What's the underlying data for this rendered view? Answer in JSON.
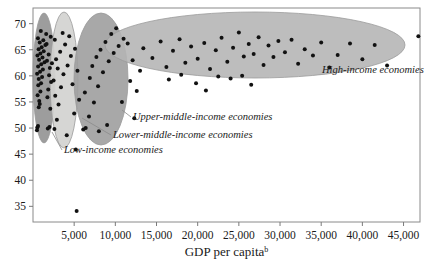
{
  "chart_data": {
    "type": "scatter",
    "title": "",
    "xlabel": "GDP per capita",
    "xlabel_superscript": "b",
    "ylabel": "",
    "xlim": [
      0,
      47000
    ],
    "ylim": [
      32,
      73
    ],
    "grid": false,
    "legend_position": "inline-annotations",
    "xticks": [
      5000,
      10000,
      15000,
      20000,
      25000,
      30000,
      35000,
      40000,
      45000
    ],
    "xtick_labels": [
      "5,000",
      "10,000",
      "15,000",
      "20,000",
      "25,000",
      "30,000",
      "35,000",
      "40,000",
      "45,000"
    ],
    "yticks": [
      35,
      40,
      45,
      50,
      55,
      60,
      65,
      70
    ],
    "ytick_labels": [
      "35",
      "40",
      "45",
      "50",
      "55",
      "60",
      "65",
      "70"
    ],
    "groups": [
      {
        "name": "low-income-economies",
        "label": "Low-income economies",
        "color": "#8c8c8c",
        "fill_opacity": 0.85,
        "ellipse": {
          "cx": 44,
          "cy": 78,
          "rx": 11,
          "ry": 65,
          "rotate": 0
        },
        "label_pos": {
          "x": 64,
          "y": 153
        },
        "leader": [
          [
            62,
            150
          ],
          [
            52,
            132
          ]
        ]
      },
      {
        "name": "lower-middle-income-economies",
        "label": "Lower-middle-income economies",
        "color": "#d3d3d0",
        "fill_opacity": 0.92,
        "ellipse": {
          "cx": 64,
          "cy": 80,
          "rx": 14,
          "ry": 68,
          "rotate": 0
        },
        "label_pos": {
          "x": 113,
          "y": 138
        },
        "leader": [
          [
            111,
            135
          ],
          [
            82,
            118
          ]
        ]
      },
      {
        "name": "upper-middle-income-economies",
        "label": "Upper-middle-income economies",
        "color": "#9e9e9e",
        "fill_opacity": 0.9,
        "ellipse": {
          "cx": 101,
          "cy": 79,
          "rx": 27,
          "ry": 66,
          "rotate": 0
        },
        "label_pos": {
          "x": 133,
          "y": 120
        },
        "leader": [
          [
            131,
            117
          ],
          [
            122,
            110
          ]
        ]
      },
      {
        "name": "high-income-economies",
        "label": "High-income economies",
        "color": "#b4b4b4",
        "fill_opacity": 0.88,
        "ellipse": {
          "cx": 255,
          "cy": 45,
          "rx": 150,
          "ry": 33,
          "rotate": 0
        },
        "label_pos": {
          "x": 322,
          "y": 73
        },
        "leader": null
      }
    ],
    "points": [
      {
        "x": 480,
        "y": 49.6
      },
      {
        "x": 520,
        "y": 50.1
      },
      {
        "x": 610,
        "y": 50.4
      },
      {
        "x": 700,
        "y": 54.0
      },
      {
        "x": 760,
        "y": 55.2
      },
      {
        "x": 820,
        "y": 54.6
      },
      {
        "x": 560,
        "y": 56.3
      },
      {
        "x": 900,
        "y": 57.0
      },
      {
        "x": 640,
        "y": 58.2
      },
      {
        "x": 980,
        "y": 58.6
      },
      {
        "x": 700,
        "y": 59.4
      },
      {
        "x": 1100,
        "y": 59.8
      },
      {
        "x": 500,
        "y": 60.4
      },
      {
        "x": 860,
        "y": 60.8
      },
      {
        "x": 1200,
        "y": 61.2
      },
      {
        "x": 620,
        "y": 61.8
      },
      {
        "x": 1000,
        "y": 62.2
      },
      {
        "x": 1400,
        "y": 62.6
      },
      {
        "x": 740,
        "y": 63.1
      },
      {
        "x": 1150,
        "y": 63.5
      },
      {
        "x": 540,
        "y": 63.9
      },
      {
        "x": 900,
        "y": 64.3
      },
      {
        "x": 1300,
        "y": 64.7
      },
      {
        "x": 680,
        "y": 65.1
      },
      {
        "x": 1050,
        "y": 65.5
      },
      {
        "x": 1500,
        "y": 65.9
      },
      {
        "x": 820,
        "y": 66.4
      },
      {
        "x": 1250,
        "y": 66.8
      },
      {
        "x": 600,
        "y": 67.2
      },
      {
        "x": 1600,
        "y": 68.0
      },
      {
        "x": 950,
        "y": 68.6
      },
      {
        "x": 1750,
        "y": 55.9
      },
      {
        "x": 1850,
        "y": 57.4
      },
      {
        "x": 1950,
        "y": 60.1
      },
      {
        "x": 2050,
        "y": 61.5
      },
      {
        "x": 1700,
        "y": 62.9
      },
      {
        "x": 1900,
        "y": 64.1
      },
      {
        "x": 1800,
        "y": 49.9
      },
      {
        "x": 2000,
        "y": 50.2
      },
      {
        "x": 2100,
        "y": 53.7
      },
      {
        "x": 2200,
        "y": 58.8
      },
      {
        "x": 2300,
        "y": 62.4
      },
      {
        "x": 1650,
        "y": 66.1
      },
      {
        "x": 2150,
        "y": 67.5
      },
      {
        "x": 2600,
        "y": 49.8
      },
      {
        "x": 2900,
        "y": 51.6
      },
      {
        "x": 3100,
        "y": 54.5
      },
      {
        "x": 2700,
        "y": 56.2
      },
      {
        "x": 3400,
        "y": 57.8
      },
      {
        "x": 2500,
        "y": 59.1
      },
      {
        "x": 3700,
        "y": 60.3
      },
      {
        "x": 3000,
        "y": 61.4
      },
      {
        "x": 4200,
        "y": 62.0
      },
      {
        "x": 2800,
        "y": 63.2
      },
      {
        "x": 4600,
        "y": 63.8
      },
      {
        "x": 3300,
        "y": 64.6
      },
      {
        "x": 5100,
        "y": 65.2
      },
      {
        "x": 3900,
        "y": 66.0
      },
      {
        "x": 2650,
        "y": 66.9
      },
      {
        "x": 4400,
        "y": 67.6
      },
      {
        "x": 3600,
        "y": 68.2
      },
      {
        "x": 5400,
        "y": 61.0
      },
      {
        "x": 4800,
        "y": 58.4
      },
      {
        "x": 5600,
        "y": 55.4
      },
      {
        "x": 5000,
        "y": 52.8
      },
      {
        "x": 5300,
        "y": 34.1
      },
      {
        "x": 5200,
        "y": 45.9
      },
      {
        "x": 4100,
        "y": 48.6
      },
      {
        "x": 6100,
        "y": 49.7
      },
      {
        "x": 6400,
        "y": 50.0
      },
      {
        "x": 6800,
        "y": 52.2
      },
      {
        "x": 7400,
        "y": 54.9
      },
      {
        "x": 6300,
        "y": 56.8
      },
      {
        "x": 7900,
        "y": 58.0
      },
      {
        "x": 6900,
        "y": 59.6
      },
      {
        "x": 8500,
        "y": 60.7
      },
      {
        "x": 7200,
        "y": 61.9
      },
      {
        "x": 9200,
        "y": 62.8
      },
      {
        "x": 7700,
        "y": 63.6
      },
      {
        "x": 9800,
        "y": 64.4
      },
      {
        "x": 8200,
        "y": 65.0
      },
      {
        "x": 10400,
        "y": 65.7
      },
      {
        "x": 8800,
        "y": 66.5
      },
      {
        "x": 11000,
        "y": 67.1
      },
      {
        "x": 9500,
        "y": 68.0
      },
      {
        "x": 10100,
        "y": 69.1
      },
      {
        "x": 11500,
        "y": 66.2
      },
      {
        "x": 12100,
        "y": 63.0
      },
      {
        "x": 11800,
        "y": 59.0
      },
      {
        "x": 12600,
        "y": 57.1
      },
      {
        "x": 10800,
        "y": 55.0
      },
      {
        "x": 12300,
        "y": 51.9
      },
      {
        "x": 9000,
        "y": 50.6
      },
      {
        "x": 8000,
        "y": 49.4
      },
      {
        "x": 13000,
        "y": 61.0
      },
      {
        "x": 13400,
        "y": 65.3
      },
      {
        "x": 14500,
        "y": 63.4
      },
      {
        "x": 15500,
        "y": 66.6
      },
      {
        "x": 16200,
        "y": 61.7
      },
      {
        "x": 17000,
        "y": 64.8
      },
      {
        "x": 17800,
        "y": 67.0
      },
      {
        "x": 18500,
        "y": 62.5
      },
      {
        "x": 19200,
        "y": 65.6
      },
      {
        "x": 20000,
        "y": 63.3
      },
      {
        "x": 20800,
        "y": 66.3
      },
      {
        "x": 21500,
        "y": 61.3
      },
      {
        "x": 22200,
        "y": 64.9
      },
      {
        "x": 22900,
        "y": 67.3
      },
      {
        "x": 23600,
        "y": 62.7
      },
      {
        "x": 24300,
        "y": 65.4
      },
      {
        "x": 25000,
        "y": 68.3
      },
      {
        "x": 25600,
        "y": 63.7
      },
      {
        "x": 26200,
        "y": 66.1
      },
      {
        "x": 26800,
        "y": 64.2
      },
      {
        "x": 27400,
        "y": 67.4
      },
      {
        "x": 28000,
        "y": 62.1
      },
      {
        "x": 28600,
        "y": 65.8
      },
      {
        "x": 29200,
        "y": 63.6
      },
      {
        "x": 29800,
        "y": 66.7
      },
      {
        "x": 24000,
        "y": 59.5
      },
      {
        "x": 25400,
        "y": 60.0
      },
      {
        "x": 26500,
        "y": 58.3
      },
      {
        "x": 22500,
        "y": 59.9
      },
      {
        "x": 19800,
        "y": 58.6
      },
      {
        "x": 18000,
        "y": 60.2
      },
      {
        "x": 16500,
        "y": 59.3
      },
      {
        "x": 21000,
        "y": 57.2
      },
      {
        "x": 30600,
        "y": 64.5
      },
      {
        "x": 31400,
        "y": 66.9
      },
      {
        "x": 32200,
        "y": 62.3
      },
      {
        "x": 33000,
        "y": 65.1
      },
      {
        "x": 34000,
        "y": 63.9
      },
      {
        "x": 35000,
        "y": 66.4
      },
      {
        "x": 36000,
        "y": 61.6
      },
      {
        "x": 37000,
        "y": 64.0
      },
      {
        "x": 38500,
        "y": 66.2
      },
      {
        "x": 40000,
        "y": 63.2
      },
      {
        "x": 41500,
        "y": 65.9
      },
      {
        "x": 43000,
        "y": 62.0
      },
      {
        "x": 46800,
        "y": 67.6
      }
    ]
  }
}
